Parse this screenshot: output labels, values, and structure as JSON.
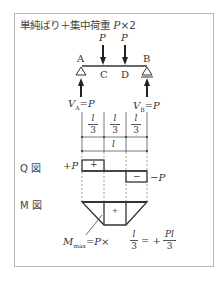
{
  "diagram": {
    "title_prefix": "単純ばり＋集中荷重 ",
    "title_var": "P",
    "title_suffix": "×2",
    "beam": {
      "support_left": "A",
      "support_right": "B",
      "point_c": "C",
      "point_d": "D",
      "load_1": "P",
      "load_2": "P",
      "reaction_left": "V",
      "reaction_left_sub": "A",
      "reaction_left_value": "=P",
      "reaction_right": "V",
      "reaction_right_sub": "B",
      "reaction_right_value": "=P"
    },
    "dimensions": {
      "segment_num": "l",
      "segment_den": "3",
      "total": "l"
    },
    "shear_diagram": {
      "label": "Q 図",
      "positive_value": "+P",
      "negative_value": "−P",
      "positive_sign": "+",
      "negative_sign": "−"
    },
    "moment_diagram": {
      "label": "M 図",
      "sign": "+",
      "max_label": "M",
      "max_sub": "max",
      "formula_mid": "=P×",
      "frac1_num": "l",
      "frac1_den": "3",
      "formula_eq": "= +",
      "frac2_num": "Pl",
      "frac2_den": "3"
    }
  }
}
